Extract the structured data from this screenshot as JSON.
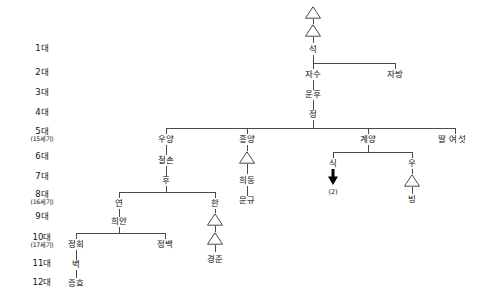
{
  "chart_title": "가계도 (Family Genealogy Chart)",
  "generations": [
    {
      "id": "gen1",
      "main": "1대",
      "sub": ""
    },
    {
      "id": "gen2",
      "main": "2대",
      "sub": ""
    },
    {
      "id": "gen3",
      "main": "3대",
      "sub": ""
    },
    {
      "id": "gen4",
      "main": "4대",
      "sub": ""
    },
    {
      "id": "gen5",
      "main": "5대",
      "sub": "(15세기)"
    },
    {
      "id": "gen6",
      "main": "6대",
      "sub": ""
    },
    {
      "id": "gen7",
      "main": "7대",
      "sub": ""
    },
    {
      "id": "gen8",
      "main": "8대",
      "sub": "(16세기)"
    },
    {
      "id": "gen9",
      "main": "9대",
      "sub": ""
    },
    {
      "id": "gen10",
      "main": "10대",
      "sub": "(17세기)"
    },
    {
      "id": "gen11",
      "main": "11대",
      "sub": ""
    },
    {
      "id": "gen12",
      "main": "12대",
      "sub": ""
    }
  ],
  "people": [
    {
      "id": "p_seok",
      "name": "석",
      "generation": "1대"
    },
    {
      "id": "p_jasu",
      "name": "자수",
      "generation": "2대"
    },
    {
      "id": "p_jabang",
      "name": "자방",
      "generation": "2대"
    },
    {
      "id": "p_unhu",
      "name": "운후",
      "generation": "3대"
    },
    {
      "id": "p_jeong",
      "name": "정",
      "generation": "4대"
    },
    {
      "id": "p_uyang",
      "name": "우양",
      "generation": "5대"
    },
    {
      "id": "p_heungyang",
      "name": "흥양",
      "generation": "5대"
    },
    {
      "id": "p_gyeyang",
      "name": "계양",
      "generation": "5대"
    },
    {
      "id": "p_ddal",
      "name": "딸 여섯",
      "generation": "5대"
    },
    {
      "id": "p_cheolson",
      "name": "철손",
      "generation": "6대"
    },
    {
      "id": "p_sik",
      "name": "식",
      "generation": "6대"
    },
    {
      "id": "p_u",
      "name": "우",
      "generation": "6대"
    },
    {
      "id": "p_hu",
      "name": "후",
      "generation": "7대"
    },
    {
      "id": "p_yeon",
      "name": "연",
      "generation": "8대"
    },
    {
      "id": "p_han",
      "name": "한",
      "generation": "8대"
    },
    {
      "id": "p_heedong",
      "name": "희동",
      "generation": "8대"
    },
    {
      "id": "p_bing",
      "name": "빙",
      "generation": "8대"
    },
    {
      "id": "p_mungyu",
      "name": "문규",
      "generation": "9대"
    },
    {
      "id": "p_heean",
      "name": "희안",
      "generation": "9대"
    },
    {
      "id": "p_jeonghoe",
      "name": "정회",
      "generation": "10대"
    },
    {
      "id": "p_jeongbaek",
      "name": "정백",
      "generation": "10대"
    },
    {
      "id": "p_gyeongjun",
      "name": "경준",
      "generation": "10대"
    },
    {
      "id": "p_byeok",
      "name": "벽",
      "generation": "11대"
    },
    {
      "id": "p_jeunghyo",
      "name": "증효",
      "generation": "12대"
    }
  ],
  "annotations": [
    {
      "id": "a_sik_count",
      "label": "(2)",
      "attached_to": "식"
    }
  ],
  "symbols": {
    "triangle_label": "생략된 세대 (omitted generation marker)",
    "arrow_label": "아래로 이어짐 (continues downward)"
  },
  "colors": {
    "line": "#4a4a4a",
    "text": "#111111",
    "background": "#ffffff",
    "arrow": "#000000"
  }
}
